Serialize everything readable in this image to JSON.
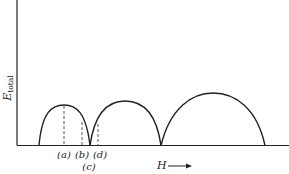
{
  "diagram": {
    "y_axis_label": "E",
    "y_axis_label_sub": "total",
    "x_axis_label": "H",
    "x_axis_arrow": "⟶",
    "markers": [
      {
        "id": "a",
        "label": "(a)"
      },
      {
        "id": "b",
        "label": "(b)"
      },
      {
        "id": "c",
        "label": "(c)"
      },
      {
        "id": "d",
        "label": "(d)"
      }
    ],
    "colors": {
      "line": "#222222",
      "background": "#ffffff"
    }
  }
}
